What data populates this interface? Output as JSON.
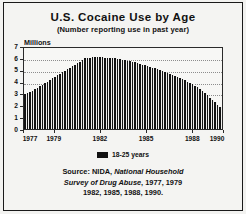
{
  "chart_data": {
    "type": "area",
    "title": "U.S. Cocaine Use by Age",
    "subtitle": "(Number reporting use in past year)",
    "ylabel": "Millions",
    "xlabel": "",
    "ylim": [
      0,
      7
    ],
    "yticks": [
      0,
      1,
      2,
      3,
      4,
      5,
      6,
      7
    ],
    "ytick_labels": [
      "0",
      "1",
      "2",
      "3",
      "4",
      "5",
      "6",
      "7"
    ],
    "grid": true,
    "grid_axis": "y",
    "xtick_labels": [
      "1977",
      "1979",
      "1982",
      "1985",
      "1988",
      "1990"
    ],
    "xtick_values": [
      1977,
      1979,
      1982,
      1985,
      1988,
      1990
    ],
    "legend_position": "bottom-center",
    "series": [
      {
        "name": "18-25 years",
        "color": "#121212",
        "x": [
          1977,
          1977.5,
          1978,
          1978.5,
          1979,
          1979.5,
          1980,
          1980.5,
          1981,
          1981.5,
          1982,
          1982.5,
          1983,
          1983.5,
          1984,
          1984.5,
          1985,
          1985.5,
          1986,
          1986.5,
          1987,
          1987.5,
          1988,
          1988.5,
          1989,
          1989.5,
          1990
        ],
        "values": [
          3.0,
          3.3,
          3.7,
          4.1,
          4.5,
          4.9,
          5.3,
          5.7,
          6.1,
          6.2,
          6.2,
          6.15,
          6.1,
          6.0,
          5.85,
          5.7,
          5.5,
          5.3,
          5.1,
          4.85,
          4.6,
          4.3,
          4.0,
          3.6,
          3.1,
          2.5,
          1.9
        ]
      }
    ],
    "annotations": []
  },
  "legend": {
    "entries": [
      {
        "label": "18-25 years",
        "swatch_color": "#121212"
      }
    ]
  },
  "source": {
    "line1_prefix": "Source: NIDA, ",
    "line1_italic": "National Household",
    "line2_italic": "Survey of Drug Abuse",
    "line2_suffix": ", 1977, 1979",
    "line3": "1982, 1985, 1988, 1990."
  },
  "colors": {
    "series_fill": "#121212",
    "frame": "#1a1a1a",
    "background": "#f4f4f2",
    "gridline": "#8d8d8d",
    "text": "#111111"
  }
}
